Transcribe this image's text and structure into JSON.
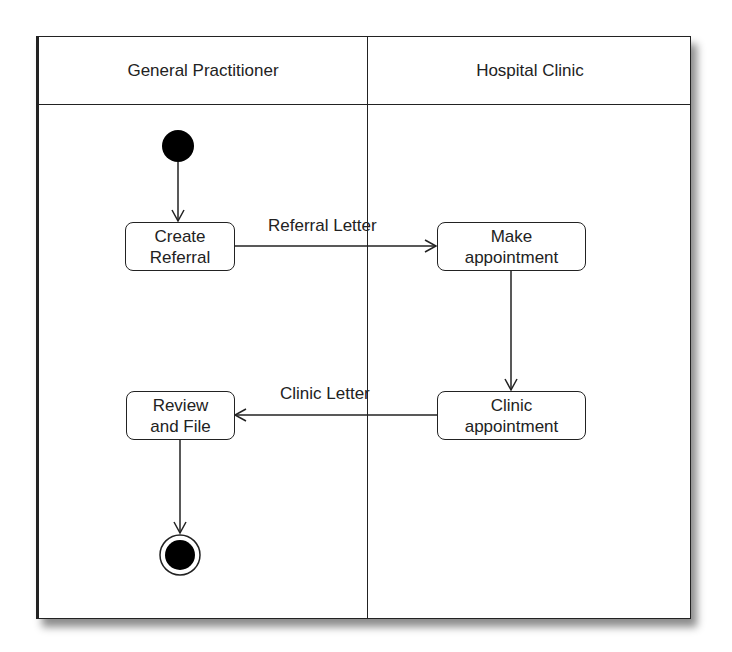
{
  "diagram": {
    "type": "UML activity diagram with swimlanes",
    "lanes": [
      {
        "id": "gp",
        "title": "General Practitioner"
      },
      {
        "id": "hc",
        "title": "Hospital Clinic"
      }
    ],
    "nodes": {
      "start": {
        "type": "initial-node",
        "lane": "gp"
      },
      "create_referral": {
        "type": "activity",
        "lane": "gp",
        "line1": "Create",
        "line2": "Referral"
      },
      "make_appointment": {
        "type": "activity",
        "lane": "hc",
        "line1": "Make",
        "line2": "appointment"
      },
      "clinic_appointment": {
        "type": "activity",
        "lane": "hc",
        "line1": "Clinic",
        "line2": "appointment"
      },
      "review_and_file": {
        "type": "activity",
        "lane": "gp",
        "line1": "Review",
        "line2": "and File"
      },
      "end": {
        "type": "final-node",
        "lane": "gp"
      }
    },
    "edges": [
      {
        "from": "start",
        "to": "create_referral",
        "label": ""
      },
      {
        "from": "create_referral",
        "to": "make_appointment",
        "label": "Referral Letter"
      },
      {
        "from": "make_appointment",
        "to": "clinic_appointment",
        "label": ""
      },
      {
        "from": "clinic_appointment",
        "to": "review_and_file",
        "label": "Clinic Letter"
      },
      {
        "from": "review_and_file",
        "to": "end",
        "label": ""
      }
    ],
    "labels": {
      "referral_letter": "Referral Letter",
      "clinic_letter": "Clinic Letter"
    },
    "colors": {
      "line": "#222222",
      "fill": "#000000",
      "background": "#ffffff"
    }
  }
}
